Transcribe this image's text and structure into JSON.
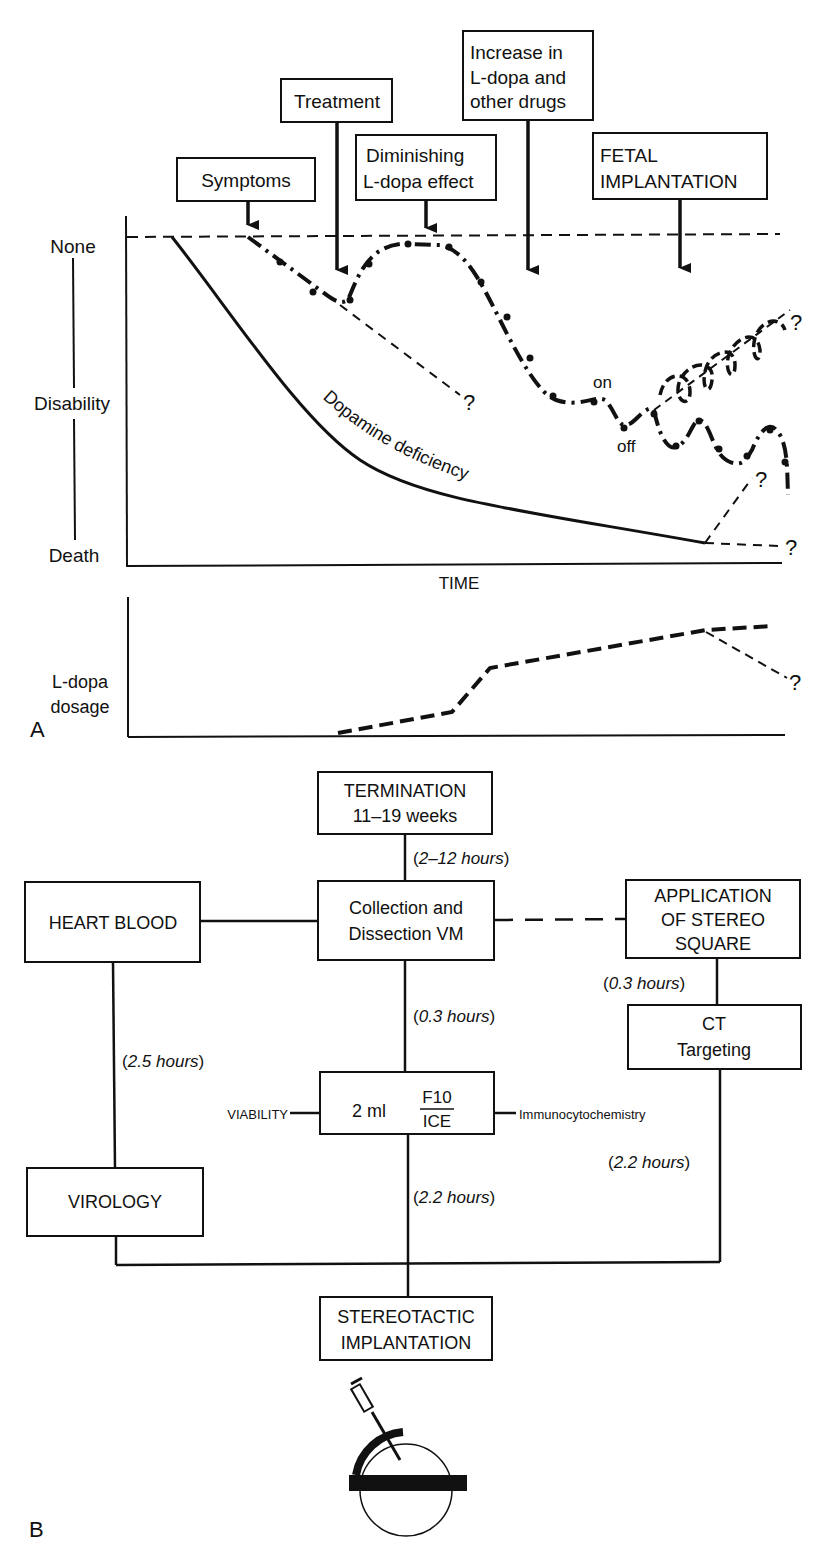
{
  "panel_a": {
    "label": "A",
    "event_boxes": [
      {
        "id": "symptoms",
        "lines": [
          "Symptoms"
        ]
      },
      {
        "id": "treatment",
        "lines": [
          "Treatment"
        ]
      },
      {
        "id": "diminishing",
        "lines": [
          "Diminishing",
          "L-dopa effect"
        ]
      },
      {
        "id": "increase",
        "lines": [
          "Increase in",
          "L-dopa and",
          "other drugs"
        ]
      },
      {
        "id": "fetal",
        "lines": [
          "FETAL",
          "IMPLANTATION"
        ]
      }
    ],
    "y_axis": {
      "top": "None",
      "middle": "Disability",
      "bottom": "Death"
    },
    "x_axis": {
      "label": "TIME"
    },
    "curve_labels": {
      "dopamine": "Dopamine deficiency",
      "on": "on",
      "off": "off",
      "question": "?"
    },
    "dosage_axis": {
      "line1": "L-dopa",
      "line2": "dosage"
    }
  },
  "panel_b": {
    "label": "B",
    "boxes": {
      "termination": [
        "TERMINATION",
        "11–19 weeks"
      ],
      "collection": [
        "Collection and",
        "Dissection VM"
      ],
      "heart_blood": [
        "HEART BLOOD"
      ],
      "application": [
        "APPLICATION",
        "OF STEREO",
        "SQUARE"
      ],
      "ct": [
        "CT",
        "Targeting"
      ],
      "medium": {
        "prefix": "2 ml",
        "numerator": "F10",
        "denominator": "ICE"
      },
      "virology": [
        "VIROLOGY"
      ],
      "stereotactic": [
        "STEREOTACTIC",
        "IMPLANTATION"
      ]
    },
    "side_labels": {
      "viability": "VIABILITY",
      "immuno": "Immunocytochemistry"
    },
    "durations": {
      "termination_to_collection": [
        "(",
        "2–12 hours",
        ")"
      ],
      "collection_to_medium": [
        "(",
        "0.3 hours",
        ")"
      ],
      "application_to_ct": [
        "(",
        "0.3 hours",
        ")"
      ],
      "heart_to_virology": [
        "(",
        "2.5 hours",
        ")"
      ],
      "medium_to_implant": [
        "(",
        "2.2 hours",
        ")"
      ],
      "ct_to_implant": [
        "(",
        "2.2 hours",
        ")"
      ]
    }
  }
}
